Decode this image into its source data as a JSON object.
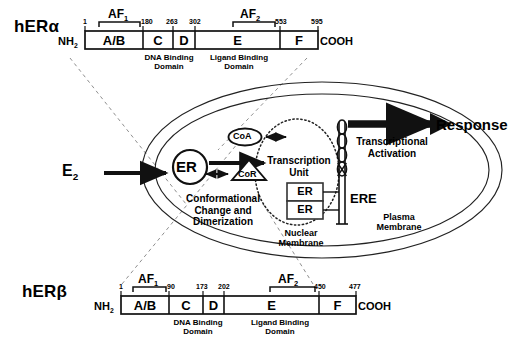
{
  "receptors": {
    "alpha": {
      "name": "hERa",
      "name_html": "hERα",
      "nterm": "NH",
      "nterm_sub": "2",
      "cterm": "COOH",
      "af1_label": "AF",
      "af1_sub": "1",
      "af2_label": "AF",
      "af2_sub": "2",
      "dna_label_line1": "DNA Binding",
      "dna_label_line2": "Domain",
      "ligand_label_line1": "Ligand Binding",
      "ligand_label_line2": "Domain",
      "segments": [
        "A/B",
        "C",
        "D",
        "E",
        "F"
      ],
      "positions": [
        "1",
        "180",
        "263",
        "302",
        "553",
        "595"
      ]
    },
    "beta": {
      "name": "hERb",
      "name_html": "hERβ",
      "nterm": "NH",
      "nterm_sub": "2",
      "cterm": "COOH",
      "af1_label": "AF",
      "af1_sub": "1",
      "af2_label": "AF",
      "af2_sub": "2",
      "dna_label_line1": "DNA Binding",
      "dna_label_line2": "Domain",
      "ligand_label_line1": "Ligand Binding",
      "ligand_label_line2": "Domain",
      "segments": [
        "A/B",
        "C",
        "D",
        "E",
        "F"
      ],
      "positions": [
        "1",
        "90",
        "173",
        "202",
        "450",
        "477"
      ]
    }
  },
  "cell": {
    "ligand": "E",
    "ligand_sub": "2",
    "receptor": "ER",
    "coactivator": "CoA",
    "corepressor": "CoR",
    "transcription_unit_line1": "Transcription",
    "transcription_unit_line2": "Unit",
    "conformational_line1": "Conformational",
    "conformational_line2": "Change and",
    "conformational_line3": "Dimerization",
    "dimer_top": "ER",
    "dimer_bottom": "ER",
    "ere": "ERE",
    "transcriptional_activation_line1": "Transcriptional",
    "transcriptional_activation_line2": "Activation",
    "response": "Response",
    "nuclear_membrane_line1": "Nuclear",
    "nuclear_membrane_line2": "Membrane",
    "plasma_membrane_line1": "Plasma",
    "plasma_membrane_line2": "Membrane"
  },
  "colors": {
    "stroke": "#1a1a1a",
    "background": "#ffffff",
    "dashed": "#8a8a8a"
  }
}
